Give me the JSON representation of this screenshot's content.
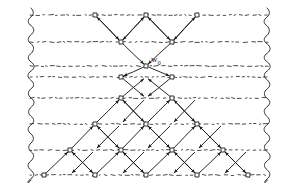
{
  "figure": {
    "name": "causal-diamond-lattice",
    "width": 298,
    "height": 188,
    "background": "#ffffff",
    "ink_color": "#1c1c1c",
    "dotted_color": "#2a2a2a"
  },
  "labels": [
    {
      "id": "w0",
      "text": "w",
      "sub": "0",
      "x": 151,
      "y": 55
    }
  ],
  "chart_data": {
    "type": "diagram",
    "title": "",
    "xlabel": "",
    "ylabel": "",
    "node_marker": "small-square",
    "node_size": 4,
    "edge_style": "arrow",
    "rows": [
      {
        "id": "r0",
        "y": 15,
        "xs": [
          95,
          146,
          197
        ]
      },
      {
        "id": "r1",
        "y": 42,
        "xs": [
          121,
          172
        ]
      },
      {
        "id": "r2",
        "y": 66,
        "xs": [
          146
        ]
      },
      {
        "id": "r3",
        "y": 77,
        "xs": [
          121,
          172
        ]
      },
      {
        "id": "r4",
        "y": 98,
        "xs": [
          121,
          172
        ]
      },
      {
        "id": "r5",
        "y": 124,
        "xs": [
          95,
          146,
          197
        ]
      },
      {
        "id": "r6",
        "y": 150,
        "xs": [
          70,
          121,
          172,
          223
        ]
      },
      {
        "id": "r7",
        "y": 175,
        "xs": [
          44,
          95,
          146,
          197,
          248
        ]
      }
    ],
    "dotted_horizontals": [
      {
        "y": 15,
        "x1": 30,
        "x2": 268
      },
      {
        "y": 42,
        "x1": 30,
        "x2": 268
      },
      {
        "y": 66,
        "x1": 30,
        "x2": 268
      },
      {
        "y": 77,
        "x1": 30,
        "x2": 268
      },
      {
        "y": 98,
        "x1": 30,
        "x2": 268
      },
      {
        "y": 124,
        "x1": 30,
        "x2": 268
      },
      {
        "y": 150,
        "x1": 30,
        "x2": 268
      },
      {
        "y": 175,
        "x1": 30,
        "x2": 268
      }
    ],
    "wavy_boundaries": [
      {
        "id": "left-wave",
        "x": 31,
        "y1": 8,
        "y2": 180
      },
      {
        "id": "right-wave",
        "x": 267,
        "y1": 8,
        "y2": 180
      }
    ],
    "edges_down_right": [
      [
        95,
        15,
        121,
        42
      ],
      [
        146,
        15,
        172,
        42
      ],
      [
        121,
        42,
        146,
        66
      ],
      [
        146,
        66,
        172,
        77
      ],
      [
        121,
        77,
        146,
        98
      ],
      [
        121,
        98,
        146,
        124
      ],
      [
        172,
        98,
        197,
        124
      ],
      [
        95,
        124,
        121,
        150
      ],
      [
        146,
        124,
        172,
        150
      ],
      [
        197,
        124,
        223,
        150
      ],
      [
        70,
        150,
        95,
        175
      ],
      [
        121,
        150,
        146,
        175
      ],
      [
        172,
        150,
        197,
        175
      ],
      [
        223,
        150,
        248,
        175
      ]
    ],
    "edges_down_left": [
      [
        146,
        15,
        121,
        42
      ],
      [
        197,
        15,
        172,
        42
      ],
      [
        172,
        42,
        146,
        66
      ],
      [
        146,
        66,
        121,
        77
      ],
      [
        172,
        77,
        146,
        98
      ],
      [
        146,
        98,
        121,
        124
      ],
      [
        197,
        98,
        172,
        124
      ],
      [
        121,
        124,
        95,
        150
      ],
      [
        172,
        124,
        146,
        150
      ],
      [
        223,
        124,
        197,
        150
      ],
      [
        95,
        150,
        70,
        175
      ],
      [
        146,
        150,
        121,
        175
      ],
      [
        197,
        150,
        172,
        175
      ],
      [
        248,
        150,
        223,
        175
      ]
    ],
    "edges_up_right": [
      [
        121,
        42,
        146,
        15
      ],
      [
        172,
        42,
        197,
        15
      ],
      [
        121,
        98,
        146,
        77
      ],
      [
        95,
        124,
        121,
        98
      ],
      [
        146,
        124,
        172,
        98
      ],
      [
        70,
        150,
        95,
        124
      ],
      [
        121,
        150,
        146,
        124
      ],
      [
        172,
        150,
        197,
        124
      ],
      [
        44,
        175,
        70,
        150
      ],
      [
        95,
        175,
        121,
        150
      ],
      [
        146,
        175,
        172,
        150
      ],
      [
        197,
        175,
        223,
        150
      ]
    ],
    "edges_up_left": [
      [
        121,
        42,
        95,
        15
      ],
      [
        172,
        42,
        146,
        15
      ],
      [
        172,
        98,
        146,
        77
      ],
      [
        146,
        124,
        121,
        98
      ],
      [
        197,
        124,
        172,
        98
      ],
      [
        121,
        150,
        95,
        124
      ],
      [
        172,
        150,
        146,
        124
      ],
      [
        223,
        150,
        197,
        124
      ],
      [
        95,
        175,
        70,
        150
      ],
      [
        146,
        175,
        121,
        150
      ],
      [
        197,
        175,
        172,
        150
      ],
      [
        248,
        175,
        223,
        150
      ]
    ]
  }
}
